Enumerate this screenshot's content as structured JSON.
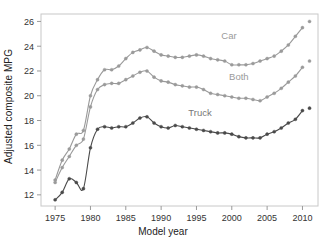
{
  "chart_data": {
    "type": "line",
    "title": "",
    "xlabel": "Model year",
    "ylabel": "Adjusted composite MPG",
    "xlim": [
      1973.0,
      2012.2
    ],
    "ylim": [
      11.1,
      26.6
    ],
    "xticks": [
      1975,
      1980,
      1985,
      1990,
      1995,
      2000,
      2005,
      2010
    ],
    "yticks": [
      12,
      14,
      16,
      18,
      20,
      22,
      24,
      26
    ],
    "grid": false,
    "legend_position": "inline-annotation",
    "x": [
      1975,
      1976,
      1977,
      1978,
      1979,
      1980,
      1981,
      1982,
      1983,
      1984,
      1985,
      1986,
      1987,
      1988,
      1989,
      1990,
      1991,
      1992,
      1993,
      1994,
      1995,
      1996,
      1997,
      1998,
      1999,
      2000,
      2001,
      2002,
      2003,
      2004,
      2005,
      2006,
      2007,
      2008,
      2009,
      2010,
      2011
    ],
    "series": [
      {
        "name": "Car",
        "color": "#9a9a9a",
        "marker": "circle",
        "values": [
          13.2,
          14.8,
          15.7,
          16.9,
          17.2,
          20.0,
          21.3,
          22.1,
          22.1,
          22.4,
          23.0,
          23.5,
          23.7,
          23.9,
          23.6,
          23.3,
          23.2,
          23.1,
          23.1,
          23.2,
          23.3,
          23.2,
          23.0,
          22.9,
          22.8,
          22.5,
          22.5,
          22.5,
          22.6,
          22.8,
          23.0,
          23.2,
          23.6,
          24.1,
          24.8,
          25.5,
          26.0
        ]
      },
      {
        "name": "Both",
        "color": "#9a9a9a",
        "marker": "circle",
        "values": [
          13.0,
          14.2,
          15.1,
          16.0,
          16.5,
          19.1,
          20.5,
          20.9,
          21.0,
          21.0,
          21.3,
          21.6,
          21.9,
          22.0,
          21.5,
          21.2,
          21.1,
          20.9,
          20.8,
          20.7,
          20.7,
          20.5,
          20.2,
          20.1,
          20.0,
          19.9,
          19.8,
          19.8,
          19.7,
          19.6,
          19.9,
          20.2,
          20.6,
          21.1,
          21.6,
          22.3,
          22.8
        ]
      },
      {
        "name": "Truck",
        "color": "#4a4a4a",
        "marker": "circle",
        "values": [
          11.6,
          12.2,
          13.3,
          13.0,
          12.5,
          15.8,
          17.3,
          17.5,
          17.4,
          17.5,
          17.5,
          17.8,
          18.2,
          18.3,
          17.8,
          17.5,
          17.4,
          17.6,
          17.5,
          17.4,
          17.3,
          17.2,
          17.1,
          17.0,
          17.0,
          16.9,
          16.7,
          16.6,
          16.6,
          16.6,
          16.9,
          17.1,
          17.4,
          17.8,
          18.1,
          18.8,
          19.0
        ]
      }
    ],
    "annotations": [
      {
        "text": "Car",
        "x": 1999.6,
        "y": 24.6,
        "color": "#9a9a9a"
      },
      {
        "text": "Both",
        "x": 2001.0,
        "y": 21.3,
        "color": "#9a9a9a"
      },
      {
        "text": "Truck",
        "x": 1995.5,
        "y": 18.4,
        "color": "#777777"
      }
    ],
    "notes": {
      "last_point_detached": true,
      "line_style": "smoothed-spline"
    }
  },
  "axes": {
    "frame_color": "#c8c8c8",
    "tick_color": "#9a9a9a",
    "tick_label_color": "#333333"
  },
  "topstrip": {
    "text": ""
  }
}
